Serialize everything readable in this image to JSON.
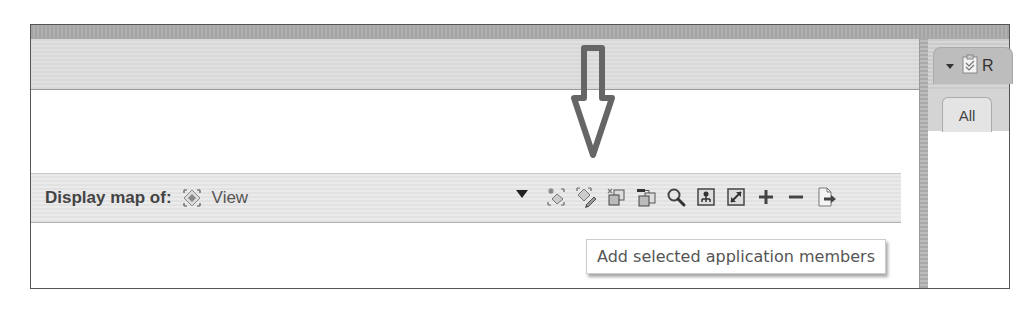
{
  "right_panel": {
    "title": "R",
    "panel_icon": "clipboard-check-icon",
    "tabs": [
      {
        "label": "All",
        "active": true
      }
    ]
  },
  "toolbar": {
    "label": "Display map of:",
    "selected_view_icon": "view-diamond-icon",
    "selected_view": "View",
    "icons": [
      {
        "name": "select-all-members-icon",
        "tooltip": ""
      },
      {
        "name": "edit-members-icon",
        "tooltip": ""
      },
      {
        "name": "add-members-icon",
        "tooltip": ""
      },
      {
        "name": "add-selected-application-members-icon",
        "tooltip": "Add selected application members"
      },
      {
        "name": "search-icon",
        "tooltip": ""
      },
      {
        "name": "hierarchy-view-icon",
        "tooltip": ""
      },
      {
        "name": "fit-to-window-icon",
        "tooltip": ""
      },
      {
        "name": "zoom-in-plus-icon",
        "tooltip": ""
      },
      {
        "name": "zoom-out-minus-icon",
        "tooltip": ""
      },
      {
        "name": "export-icon",
        "tooltip": ""
      }
    ]
  },
  "tooltip": {
    "text": "Add selected application members"
  },
  "annotation": {
    "type": "down-arrow",
    "color": "#666666"
  }
}
